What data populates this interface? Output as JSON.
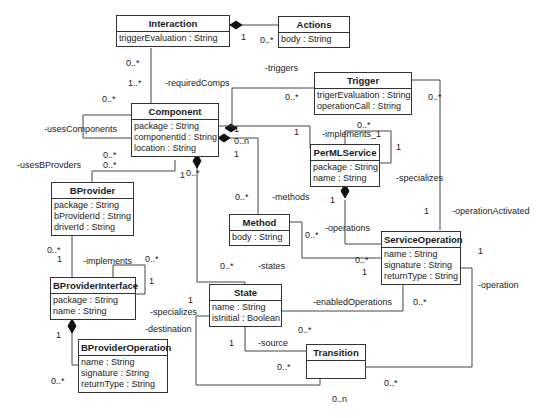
{
  "classes": {
    "interaction": {
      "name": "Interaction",
      "attrs": [
        "triggerEvaluation : String"
      ]
    },
    "actions": {
      "name": "Actions",
      "attrs": [
        "body : String"
      ]
    },
    "trigger": {
      "name": "Trigger",
      "attrs": [
        "trigerEvaluation : String",
        "operationCall : String"
      ]
    },
    "component": {
      "name": "Component",
      "attrs": [
        "package : String",
        "componentId : String",
        "location : String"
      ]
    },
    "permlservice": {
      "name": "PerMLService",
      "attrs": [
        "package : String",
        "name : String"
      ]
    },
    "bprovider": {
      "name": "BProvider",
      "attrs": [
        "package : String",
        "bProviderId : String",
        "driverId : String"
      ]
    },
    "method": {
      "name": "Method",
      "attrs": [
        "body : String"
      ]
    },
    "serviceoperation": {
      "name": "ServiceOperation",
      "attrs": [
        "name : String",
        "signature : String",
        "returnType : String"
      ]
    },
    "bproviderinterface": {
      "name": "BProviderInterface",
      "attrs": [
        "package : String",
        "name : String"
      ]
    },
    "state": {
      "name": "State",
      "attrs": [
        "name : String",
        "isInitial : Boolean"
      ]
    },
    "bprovideroperation": {
      "name": "BProviderOperation",
      "attrs": [
        "name : String",
        "signature : String",
        "returnType : String"
      ]
    },
    "transition": {
      "name": "Transition",
      "attrs": []
    }
  },
  "labels": {
    "interaction_actions_1": "1",
    "interaction_actions_many": "0..*",
    "interaction_component_top": "0..*",
    "interaction_component_bottom": "1..*",
    "required_comps": "-requiredComps",
    "triggers": "-triggers",
    "trigger_comp_mult": "0..*",
    "trigger_right_mult": "0..*",
    "uses_components_mult": "0..*",
    "uses_components": "-usesComponents",
    "uses_bprovders": "-usesBProvders",
    "comp_bprov_mult1": "0..*",
    "comp_bprov_mult2": "0..*",
    "comp_right_1": "1",
    "comp_0n": "0..n",
    "comp_right_1b": "1",
    "perml_1": "1",
    "implements_1": "-implements_1",
    "implements_1_mult": "0..*",
    "implements_1_one": "1",
    "specializes_top": "-specializes",
    "comp_down_1": "1",
    "comp_down_many": "0..*",
    "methods_mult": "0..*",
    "methods": "-methods",
    "perml_ops_1": "1",
    "operations": "-operations",
    "operation_activated_1": "1",
    "operation_activated": "-operationActivated",
    "method_so_many": "0..*",
    "so_method_many": "0..*",
    "so_method_one": "1",
    "so_right_1": "1",
    "operation": "-operation",
    "bprov_bpi_many": "0..*",
    "bprov_bpi_one": "1",
    "implements": "-implements",
    "bpi_self_many": "0..*",
    "bpi_self_one": "1",
    "states_many": "0..*",
    "states": "-states",
    "specializes_left_1": "1",
    "specializes_left": "-specializes",
    "destination": "-destination",
    "bpi_bpo_1": "1",
    "bpo_many": "0..*",
    "enabled_operations": "-enabledOperations",
    "enabled_ops_many": "0..*",
    "state_trans_many": "0..*",
    "source_1": "1",
    "source": "-source",
    "trans_left_many": "0..*",
    "trans_right_many": "0..*",
    "trans_0n": "0..n"
  }
}
